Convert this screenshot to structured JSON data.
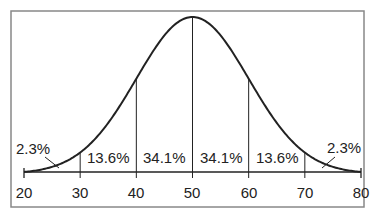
{
  "chart_data": {
    "type": "area",
    "title": "",
    "xlabel": "",
    "ylabel": "",
    "mean": 50,
    "sd": 10,
    "xlim": [
      20,
      80
    ],
    "x_ticks": [
      20,
      30,
      40,
      50,
      60,
      70,
      80
    ],
    "x_tick_labels": [
      "20",
      "30",
      "40",
      "50",
      "60",
      "70",
      "80"
    ],
    "dividers_at": [
      30,
      40,
      50,
      60,
      70
    ],
    "regions": [
      {
        "from": 20,
        "to": 30,
        "percent": 2.3,
        "label": "2.3%"
      },
      {
        "from": 30,
        "to": 40,
        "percent": 13.6,
        "label": "13.6%"
      },
      {
        "from": 40,
        "to": 50,
        "percent": 34.1,
        "label": "34.1%"
      },
      {
        "from": 50,
        "to": 60,
        "percent": 34.1,
        "label": "34.1%"
      },
      {
        "from": 60,
        "to": 70,
        "percent": 13.6,
        "label": "13.6%"
      },
      {
        "from": 70,
        "to": 80,
        "percent": 2.3,
        "label": "2.3%"
      }
    ],
    "grid": false,
    "legend": null
  },
  "colors": {
    "line": "#222222",
    "frame": "#888888",
    "background": "#ffffff"
  }
}
